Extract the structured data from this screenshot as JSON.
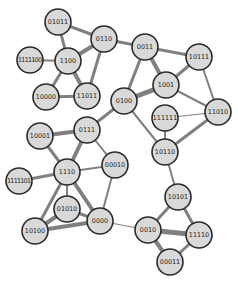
{
  "diagram": {
    "type": "network-graph",
    "node_fill": "#d9d9d9",
    "node_stroke": "#2a2a2a",
    "edge_color": "#808080",
    "node_radius": 13,
    "nodes": [
      {
        "id": "01011",
        "label": "01011",
        "x": 58,
        "y": 22
      },
      {
        "id": "0110",
        "label": "0110",
        "x": 104,
        "y": 39
      },
      {
        "id": "1100",
        "label": "1100",
        "x": 68,
        "y": 61
      },
      {
        "id": "1111100",
        "label": "1111100",
        "x": 30,
        "y": 60
      },
      {
        "id": "10000",
        "label": "10000",
        "x": 46,
        "y": 97
      },
      {
        "id": "11011",
        "label": "11011",
        "x": 87,
        "y": 96
      },
      {
        "id": "0011",
        "label": "0011",
        "x": 145,
        "y": 47
      },
      {
        "id": "10111",
        "label": "10111",
        "x": 199,
        "y": 57
      },
      {
        "id": "1001",
        "label": "1001",
        "x": 166,
        "y": 85
      },
      {
        "id": "0100",
        "label": "0100",
        "x": 124,
        "y": 101
      },
      {
        "id": "111111",
        "label": "111111",
        "x": 165,
        "y": 118
      },
      {
        "id": "11010",
        "label": "11010",
        "x": 218,
        "y": 112
      },
      {
        "id": "10110",
        "label": "10110",
        "x": 165,
        "y": 152
      },
      {
        "id": "10001",
        "label": "10001",
        "x": 40,
        "y": 136
      },
      {
        "id": "0111",
        "label": "0111",
        "x": 87,
        "y": 130
      },
      {
        "id": "00010",
        "label": "00010",
        "x": 115,
        "y": 165
      },
      {
        "id": "1110",
        "label": "1110",
        "x": 67,
        "y": 172
      },
      {
        "id": "1111101",
        "label": "1111101",
        "x": 19,
        "y": 181
      },
      {
        "id": "01010",
        "label": "01010",
        "x": 67,
        "y": 209
      },
      {
        "id": "0000",
        "label": "0000",
        "x": 100,
        "y": 221
      },
      {
        "id": "10100",
        "label": "10100",
        "x": 35,
        "y": 231
      },
      {
        "id": "10101",
        "label": "10101",
        "x": 178,
        "y": 197
      },
      {
        "id": "0010",
        "label": "0010",
        "x": 148,
        "y": 230
      },
      {
        "id": "11110",
        "label": "11110",
        "x": 199,
        "y": 235
      },
      {
        "id": "00011",
        "label": "00011",
        "x": 170,
        "y": 262
      }
    ],
    "edges": [
      {
        "source": "01011",
        "target": "0110",
        "weight": 3
      },
      {
        "source": "01011",
        "target": "1100",
        "weight": 3
      },
      {
        "source": "0110",
        "target": "1100",
        "weight": 4
      },
      {
        "source": "0110",
        "target": "11011",
        "weight": 3
      },
      {
        "source": "0110",
        "target": "0011",
        "weight": 3
      },
      {
        "source": "1111100",
        "target": "1100",
        "weight": 2
      },
      {
        "source": "1100",
        "target": "10000",
        "weight": 3
      },
      {
        "source": "1100",
        "target": "11011",
        "weight": 4
      },
      {
        "source": "10000",
        "target": "11011",
        "weight": 3
      },
      {
        "source": "0011",
        "target": "10111",
        "weight": 3
      },
      {
        "source": "0011",
        "target": "1001",
        "weight": 4
      },
      {
        "source": "0011",
        "target": "0100",
        "weight": 3
      },
      {
        "source": "10111",
        "target": "1001",
        "weight": 3
      },
      {
        "source": "10111",
        "target": "11010",
        "weight": 2
      },
      {
        "source": "1001",
        "target": "0100",
        "weight": 5
      },
      {
        "source": "1001",
        "target": "11010",
        "weight": 2
      },
      {
        "source": "111111",
        "target": "11010",
        "weight": 1
      },
      {
        "source": "111111",
        "target": "10110",
        "weight": 2
      },
      {
        "source": "11010",
        "target": "10110",
        "weight": 3
      },
      {
        "source": "0100",
        "target": "10110",
        "weight": 2
      },
      {
        "source": "0100",
        "target": "0111",
        "weight": 3
      },
      {
        "source": "10001",
        "target": "0111",
        "weight": 4
      },
      {
        "source": "0111",
        "target": "1110",
        "weight": 4
      },
      {
        "source": "0111",
        "target": "00010",
        "weight": 2
      },
      {
        "source": "1110",
        "target": "00010",
        "weight": 2
      },
      {
        "source": "1111101",
        "target": "1110",
        "weight": 3
      },
      {
        "source": "10001",
        "target": "1110",
        "weight": 3
      },
      {
        "source": "1110",
        "target": "01010",
        "weight": 2
      },
      {
        "source": "1110",
        "target": "10100",
        "weight": 3
      },
      {
        "source": "1110",
        "target": "0000",
        "weight": 4
      },
      {
        "source": "00010",
        "target": "0000",
        "weight": 2
      },
      {
        "source": "01010",
        "target": "10100",
        "weight": 4
      },
      {
        "source": "01010",
        "target": "0000",
        "weight": 3
      },
      {
        "source": "10100",
        "target": "0000",
        "weight": 4
      },
      {
        "source": "0000",
        "target": "0010",
        "weight": 1
      },
      {
        "source": "10110",
        "target": "10101",
        "weight": 2
      },
      {
        "source": "10101",
        "target": "0010",
        "weight": 3
      },
      {
        "source": "10101",
        "target": "11110",
        "weight": 3
      },
      {
        "source": "0010",
        "target": "11110",
        "weight": 5
      },
      {
        "source": "0010",
        "target": "00011",
        "weight": 4
      },
      {
        "source": "11110",
        "target": "00011",
        "weight": 3
      }
    ]
  }
}
